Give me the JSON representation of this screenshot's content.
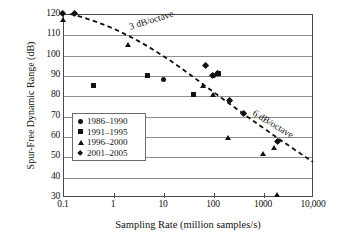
{
  "chart_data": {
    "type": "scatter",
    "title": "",
    "xlabel": "Sampling Rate (million samples/s)",
    "ylabel": "Spur-Free Dynamic Range (dB)",
    "xscale": "log",
    "yscale": "linear",
    "xlim": [
      0.1,
      10000
    ],
    "ylim": [
      30,
      120
    ],
    "grid": "horizontal",
    "legend_position": "center-left",
    "xticks": [
      "0.1",
      "1",
      "10",
      "100",
      "1000",
      "10,000"
    ],
    "xtick_values": [
      0.1,
      1,
      10,
      100,
      1000,
      10000
    ],
    "yticks": [
      "30",
      "40",
      "50",
      "60",
      "70",
      "80",
      "90",
      "100",
      "110",
      "120"
    ],
    "ytick_values": [
      30,
      40,
      50,
      60,
      70,
      80,
      90,
      100,
      110,
      120
    ],
    "series": [
      {
        "name": "1986–1990",
        "marker": "circle",
        "points": [
          {
            "x": 10,
            "y": 88
          },
          {
            "x": 100,
            "y": 89.8
          }
        ]
      },
      {
        "name": "1991–1995",
        "marker": "square",
        "points": [
          {
            "x": 0.4,
            "y": 85
          },
          {
            "x": 5,
            "y": 90
          },
          {
            "x": 40,
            "y": 80.4
          },
          {
            "x": 130,
            "y": 90.8
          }
        ]
      },
      {
        "name": "1996–2000",
        "marker": "triangle",
        "points": [
          {
            "x": 0.1,
            "y": 117
          },
          {
            "x": 2,
            "y": 104.7
          },
          {
            "x": 65,
            "y": 84.6
          },
          {
            "x": 100,
            "y": 80.2
          },
          {
            "x": 205,
            "y": 58.8
          },
          {
            "x": 1000,
            "y": 51.2
          },
          {
            "x": 1700,
            "y": 54
          },
          {
            "x": 1900,
            "y": 30.7
          }
        ]
      },
      {
        "name": "2001–2005",
        "marker": "diamond",
        "points": [
          {
            "x": 0.1,
            "y": 120
          },
          {
            "x": 0.17,
            "y": 120
          },
          {
            "x": 70,
            "y": 94.5
          },
          {
            "x": 100,
            "y": 89.8
          },
          {
            "x": 125,
            "y": 90.9
          },
          {
            "x": 210,
            "y": 77.2
          },
          {
            "x": 400,
            "y": 70.8
          },
          {
            "x": 2000,
            "y": 57.4
          }
        ]
      }
    ],
    "annotations": [
      {
        "text": "3 dB/octave",
        "x": 3.5,
        "y": 112
      },
      {
        "text": "6 dB/octave",
        "x": 1200,
        "y": 74
      }
    ],
    "trendline": {
      "style": "dashed",
      "points": [
        {
          "x": 0.13,
          "y": 120
        },
        {
          "x": 150,
          "y": 88
        },
        {
          "x": 10000,
          "y": 52
        }
      ]
    }
  },
  "legend": {
    "items": [
      {
        "label": "1986–1990",
        "marker": "circle"
      },
      {
        "label": "1991–1995",
        "marker": "square"
      },
      {
        "label": "1996–2000",
        "marker": "triangle"
      },
      {
        "label": "2001–2005",
        "marker": "diamond"
      }
    ]
  },
  "colors": {
    "marker": "#111111",
    "gridline": "#8e8e8e",
    "frame": "#4a4a4a",
    "background": "#ffffff"
  }
}
